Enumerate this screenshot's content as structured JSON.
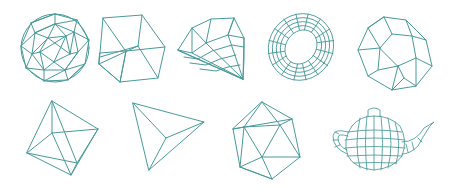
{
  "figure": {
    "background": "#ffffff",
    "stroke_color": "#4a9a9a",
    "layout": {
      "rows": 2,
      "top_row_count": 5,
      "bottom_row_count": 4
    },
    "shapes": [
      {
        "id": "geodesic-sphere",
        "label": "Geodesic sphere",
        "row": 1,
        "col": 1
      },
      {
        "id": "cube",
        "label": "Cube",
        "row": 1,
        "col": 2
      },
      {
        "id": "diamond",
        "label": "Diamond (gem)",
        "row": 1,
        "col": 3
      },
      {
        "id": "torus",
        "label": "Torus",
        "row": 1,
        "col": 4
      },
      {
        "id": "dodecahedron",
        "label": "Dodecahedron",
        "row": 1,
        "col": 5
      },
      {
        "id": "octahedron",
        "label": "Octahedron",
        "row": 2,
        "col": 1
      },
      {
        "id": "tetrahedron",
        "label": "Tetrahedron",
        "row": 2,
        "col": 2
      },
      {
        "id": "icosahedron",
        "label": "Icosahedron",
        "row": 2,
        "col": 3
      },
      {
        "id": "teapot",
        "label": "Utah teapot",
        "row": 2,
        "col": 4
      }
    ]
  }
}
